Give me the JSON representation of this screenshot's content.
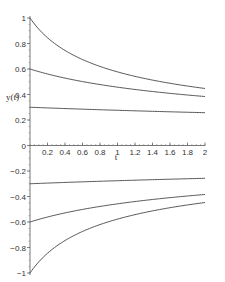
{
  "chart_data": {
    "type": "line",
    "title": "",
    "xlabel": "t",
    "ylabel": "y(t)",
    "xlim": [
      0,
      2
    ],
    "ylim": [
      -1,
      1
    ],
    "grid": false,
    "legend": null,
    "x_ticks": [
      "0.2",
      "0.4",
      "0.6",
      "0.8",
      "1",
      "1.2",
      "1.4",
      "1.6",
      "1.8",
      "2"
    ],
    "y_ticks": [
      "1",
      "0.8",
      "0.6",
      "0.4",
      "0.2",
      "0",
      "-0.2",
      "-0.4",
      "-0.6",
      "-0.8",
      "-1"
    ],
    "x": [
      0,
      0.25,
      0.5,
      0.75,
      1.0,
      1.25,
      1.5,
      1.75,
      2.0
    ],
    "series": [
      {
        "name": "y0=1",
        "values": [
          1.0,
          0.816,
          0.707,
          0.632,
          0.577,
          0.535,
          0.5,
          0.471,
          0.447
        ]
      },
      {
        "name": "y0=0.6",
        "values": [
          0.6,
          0.548,
          0.508,
          0.476,
          0.449,
          0.426,
          0.406,
          0.389,
          0.384
        ]
      },
      {
        "name": "y0=0.3",
        "values": [
          0.3,
          0.294,
          0.288,
          0.283,
          0.278,
          0.273,
          0.268,
          0.264,
          0.257
        ]
      },
      {
        "name": "y0=-0.3",
        "values": [
          -0.3,
          -0.294,
          -0.288,
          -0.283,
          -0.278,
          -0.273,
          -0.268,
          -0.264,
          -0.257
        ]
      },
      {
        "name": "y0=-0.6",
        "values": [
          -0.6,
          -0.548,
          -0.508,
          -0.476,
          -0.449,
          -0.426,
          -0.406,
          -0.389,
          -0.384
        ]
      },
      {
        "name": "y0=-1",
        "values": [
          -1.0,
          -0.816,
          -0.707,
          -0.632,
          -0.577,
          -0.535,
          -0.5,
          -0.471,
          -0.447
        ]
      }
    ]
  }
}
